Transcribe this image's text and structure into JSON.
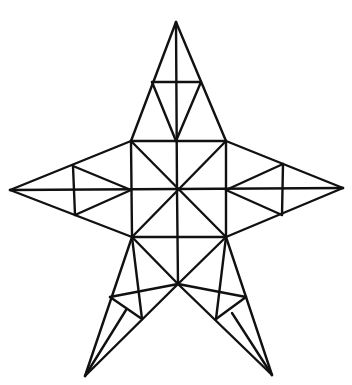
{
  "figure": {
    "stroke_color": "#111111",
    "background": "#ffffff",
    "lines": [
      [
        176,
        22,
        131,
        141
      ],
      [
        176,
        22,
        226,
        141
      ],
      [
        176,
        22,
        177,
        190
      ],
      [
        152,
        82,
        201,
        82
      ],
      [
        152,
        82,
        176,
        141
      ],
      [
        201,
        82,
        176,
        141
      ],
      [
        131,
        141,
        226,
        141
      ],
      [
        226,
        141,
        226,
        237
      ],
      [
        226,
        237,
        132,
        237
      ],
      [
        132,
        237,
        131,
        141
      ],
      [
        131,
        141,
        226,
        237
      ],
      [
        226,
        141,
        132,
        237
      ],
      [
        10,
        190,
        343,
        188
      ],
      [
        177,
        190,
        178,
        284
      ],
      [
        10,
        190,
        131,
        141
      ],
      [
        10,
        190,
        132,
        237
      ],
      [
        73,
        166,
        75,
        215
      ],
      [
        73,
        166,
        131,
        190
      ],
      [
        75,
        215,
        131,
        190
      ],
      [
        343,
        188,
        226,
        141
      ],
      [
        343,
        188,
        226,
        237
      ],
      [
        283,
        164,
        282,
        215
      ],
      [
        283,
        164,
        226,
        190
      ],
      [
        282,
        215,
        226,
        190
      ],
      [
        132,
        237,
        178,
        284
      ],
      [
        226,
        237,
        178,
        284
      ],
      [
        132,
        237,
        85,
        376
      ],
      [
        178,
        284,
        85,
        376
      ],
      [
        110,
        297,
        178,
        284
      ],
      [
        110,
        297,
        142,
        319
      ],
      [
        132,
        237,
        142,
        319
      ],
      [
        126,
        310,
        85,
        376
      ],
      [
        226,
        237,
        272,
        375
      ],
      [
        178,
        284,
        272,
        375
      ],
      [
        246,
        297,
        178,
        284
      ],
      [
        246,
        297,
        216,
        319
      ],
      [
        226,
        237,
        216,
        319
      ],
      [
        232,
        313,
        272,
        375
      ]
    ]
  }
}
